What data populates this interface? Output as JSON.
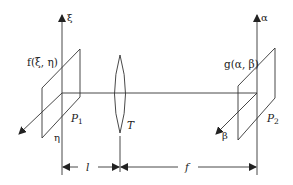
{
  "diagram": {
    "type": "optical-fourier-transform-setup",
    "input_plane": {
      "name": "P1",
      "name_main": "P",
      "name_sub": "1",
      "function_label": "f(ξ, η)",
      "vertical_axis": "ξ",
      "depth_axis": "η"
    },
    "lens": {
      "label": "T"
    },
    "output_plane": {
      "name": "P2",
      "name_main": "P",
      "name_sub": "2",
      "function_label": "g(α, β)",
      "vertical_axis": "α",
      "depth_axis": "β"
    },
    "dimensions": [
      {
        "label": "l",
        "from": "P1",
        "to": "T"
      },
      {
        "label": "f",
        "from": "T",
        "to": "P2"
      }
    ],
    "colors": {
      "line": "#333333",
      "text": "#222222",
      "background": "#ffffff"
    }
  }
}
